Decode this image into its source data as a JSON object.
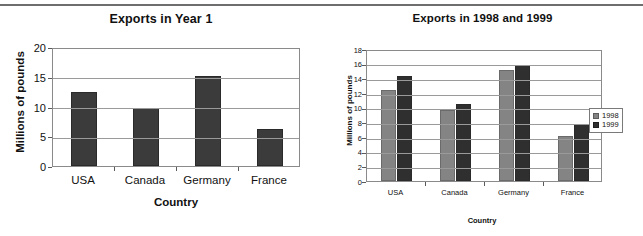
{
  "page": {
    "divider": "horizontal-rule"
  },
  "chart_data": [
    {
      "type": "bar",
      "title": "Exports in Year 1",
      "xlabel": "Country",
      "ylabel": "Millions of pounds",
      "categories": [
        "USA",
        "Canada",
        "Germany",
        "France"
      ],
      "values": [
        12.4,
        9.8,
        15.2,
        6.3
      ],
      "ylim": [
        0,
        20
      ],
      "yticks": [
        0,
        5,
        10,
        15,
        20
      ],
      "grid": true,
      "legend": "none",
      "series_color": "#3b3b3b"
    },
    {
      "type": "bar",
      "title": "Exports in 1998 and 1999",
      "xlabel": "Country",
      "ylabel": "Millions of pounds",
      "categories": [
        "USA",
        "Canada",
        "Germany",
        "France"
      ],
      "series": [
        {
          "name": "1998",
          "values": [
            12.4,
            9.7,
            15.1,
            6.2
          ],
          "color": "#848484"
        },
        {
          "name": "1999",
          "values": [
            14.3,
            10.5,
            15.8,
            7.8
          ],
          "color": "#2f2f2f"
        }
      ],
      "ylim": [
        0,
        18
      ],
      "yticks": [
        0,
        2,
        4,
        6,
        8,
        10,
        12,
        14,
        16,
        18
      ],
      "grid": true,
      "legend": "right",
      "legend_entries": [
        "1998",
        "1999"
      ]
    }
  ]
}
